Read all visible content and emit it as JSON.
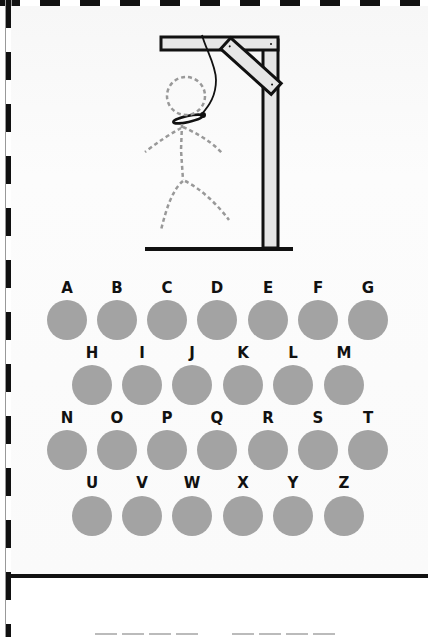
{
  "game": {
    "title": "Hangman",
    "colors": {
      "key_fill": "#a3a3a3",
      "wood": "#e6e6e6",
      "outline": "#111111",
      "figure_dash": "#999999"
    },
    "figure_parts_shown": [
      "head",
      "body",
      "left-arm",
      "right-arm",
      "left-leg",
      "right-leg"
    ],
    "figure_style": "dashed-outline",
    "keyboard": {
      "rows": [
        [
          "A",
          "B",
          "C",
          "D",
          "E",
          "F",
          "G"
        ],
        [
          "H",
          "I",
          "J",
          "K",
          "L",
          "M"
        ],
        [
          "N",
          "O",
          "P",
          "Q",
          "R",
          "S",
          "T"
        ],
        [
          "U",
          "V",
          "W",
          "X",
          "Y",
          "Z"
        ]
      ]
    },
    "word": {
      "words": [
        {
          "letters": [
            "",
            "",
            "",
            ""
          ]
        },
        {
          "letters": [
            "",
            "",
            "",
            ""
          ]
        }
      ]
    }
  }
}
